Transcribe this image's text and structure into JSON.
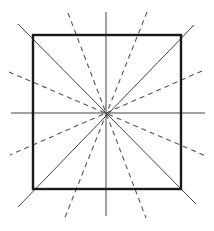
{
  "diagram": {
    "width": 214,
    "height": 231,
    "colors": {
      "background": "#ffffff",
      "square_stroke": "#1a1a1a",
      "solid_line": "#444444",
      "dashed_line": "#555555"
    },
    "center": [
      106,
      113
    ],
    "square": {
      "x1": 33,
      "y1": 35,
      "x2": 181,
      "y2": 189,
      "stroke_width": 2.4
    },
    "symmetry_lines": [
      {
        "name": "vertical-axis",
        "x1": 106,
        "y1": 12,
        "x2": 106,
        "y2": 216,
        "style": "solid"
      },
      {
        "name": "horizontal-axis",
        "x1": 11,
        "y1": 113,
        "x2": 205,
        "y2": 113,
        "style": "solid"
      },
      {
        "name": "diagonal-main",
        "x1": 18,
        "y1": 24,
        "x2": 196,
        "y2": 204,
        "style": "solid"
      },
      {
        "name": "diagonal-anti",
        "x1": 194,
        "y1": 25,
        "x2": 18,
        "y2": 207,
        "style": "solid"
      }
    ],
    "non_symmetry_lines": [
      {
        "name": "dashed-steep-left",
        "x1": 68,
        "y1": 13,
        "x2": 146,
        "y2": 218,
        "style": "dashed"
      },
      {
        "name": "dashed-steep-right",
        "x1": 147,
        "y1": 12,
        "x2": 64,
        "y2": 220,
        "style": "dashed"
      },
      {
        "name": "dashed-shallow-left",
        "x1": 9,
        "y1": 72,
        "x2": 206,
        "y2": 156,
        "style": "dashed"
      },
      {
        "name": "dashed-shallow-right",
        "x1": 202,
        "y1": 71,
        "x2": 10,
        "y2": 155,
        "style": "dashed"
      }
    ]
  }
}
